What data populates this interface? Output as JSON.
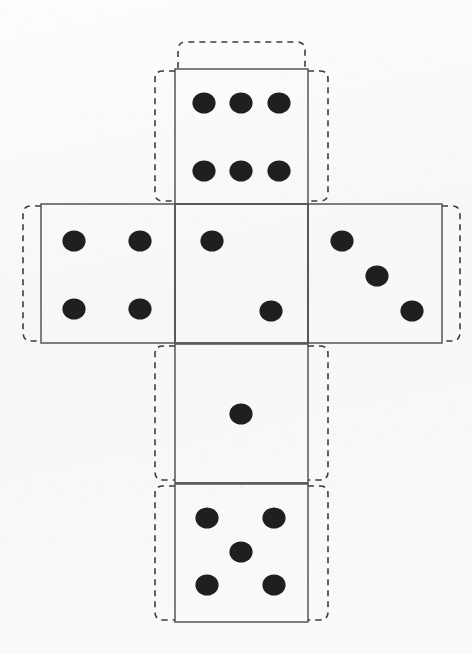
{
  "document": {
    "title": "Dice Net Cut-Out Template",
    "kind": "printable-cube-net",
    "background_color": "#fbfbfb",
    "pip_color": "#1f1f1f",
    "cut_line_color": "#4a4a4a",
    "fold_line_color": "#5a5a5a",
    "tab_line_color": "#3c3c3c",
    "canvas": {
      "width": 472,
      "height": 654
    }
  },
  "net": {
    "face_size": 134,
    "pip_radius": 11,
    "tab_extent": 18,
    "tab_corner_radius": 26,
    "faces": [
      {
        "id": "face-top",
        "name": "top-face",
        "value": 6,
        "value_label": "6",
        "x": 175,
        "y": 69,
        "width": 133,
        "height": 135,
        "pips": [
          {
            "cx": 204,
            "cy": 103
          },
          {
            "cx": 241,
            "cy": 103
          },
          {
            "cx": 279,
            "cy": 103
          },
          {
            "cx": 204,
            "cy": 171
          },
          {
            "cx": 241,
            "cy": 171
          },
          {
            "cx": 279,
            "cy": 171
          }
        ],
        "tabs": [
          "top",
          "left",
          "right"
        ]
      },
      {
        "id": "face-left",
        "name": "left-face",
        "value": 4,
        "value_label": "4",
        "x": 41,
        "y": 204,
        "width": 134,
        "height": 139,
        "pips": [
          {
            "cx": 74,
            "cy": 241
          },
          {
            "cx": 140,
            "cy": 241
          },
          {
            "cx": 74,
            "cy": 309
          },
          {
            "cx": 140,
            "cy": 309
          }
        ],
        "tabs": [
          "left"
        ]
      },
      {
        "id": "face-front",
        "name": "front-face",
        "value": 2,
        "value_label": "2",
        "x": 175,
        "y": 204,
        "width": 133,
        "height": 139,
        "pips": [
          {
            "cx": 212,
            "cy": 241
          },
          {
            "cx": 271,
            "cy": 311
          }
        ],
        "tabs": []
      },
      {
        "id": "face-right",
        "name": "right-face",
        "value": 3,
        "value_label": "3",
        "x": 308,
        "y": 204,
        "width": 134,
        "height": 139,
        "pips": [
          {
            "cx": 342,
            "cy": 241
          },
          {
            "cx": 377,
            "cy": 276
          },
          {
            "cx": 412,
            "cy": 311
          }
        ],
        "tabs": [
          "right"
        ]
      },
      {
        "id": "face-back",
        "name": "back-face",
        "value": 1,
        "value_label": "1",
        "x": 175,
        "y": 344,
        "width": 133,
        "height": 139,
        "pips": [
          {
            "cx": 241,
            "cy": 414
          }
        ],
        "tabs": [
          "left",
          "right"
        ]
      },
      {
        "id": "face-bottom",
        "name": "bottom-face",
        "value": 5,
        "value_label": "5",
        "x": 175,
        "y": 484,
        "width": 133,
        "height": 138,
        "pips": [
          {
            "cx": 207,
            "cy": 518
          },
          {
            "cx": 274,
            "cy": 518
          },
          {
            "cx": 241,
            "cy": 552
          },
          {
            "cx": 207,
            "cy": 585
          },
          {
            "cx": 274,
            "cy": 585
          }
        ],
        "tabs": [
          "left",
          "right",
          "bottom"
        ]
      }
    ],
    "glue_tabs": [
      {
        "id": "tab-top",
        "name": "glue-tab-top",
        "d": "M 178 68 L 178 50 Q 178 42 186 42 L 297 42 Q 305 42 305 50 L 305 68"
      },
      {
        "id": "tab-top-left",
        "name": "glue-tab-top-left",
        "d": "M 175 71 L 163 71 Q 155 71 155 79 L 155 193 Q 155 201 163 201 L 175 201"
      },
      {
        "id": "tab-top-right",
        "name": "glue-tab-top-right",
        "d": "M 308 71 L 320 71 Q 328 71 328 79 L 328 193 Q 328 201 320 201 L 308 201"
      },
      {
        "id": "tab-left",
        "name": "glue-tab-left",
        "d": "M 41 206 L 31 206 Q 23 206 23 214 L 23 332 Q 23 341 31 341 L 41 341"
      },
      {
        "id": "tab-right",
        "name": "glue-tab-right",
        "d": "M 442 206 L 452 206 Q 460 206 460 214 L 460 332 Q 460 341 452 341 L 442 341"
      },
      {
        "id": "tab-back-left",
        "name": "glue-tab-back-left",
        "d": "M 175 346 L 163 346 Q 155 346 155 354 L 155 472 Q 155 480 163 480 L 175 480"
      },
      {
        "id": "tab-back-right",
        "name": "glue-tab-back-right",
        "d": "M 308 346 L 320 346 Q 328 346 328 354 L 328 472 Q 328 480 320 480 L 308 480"
      },
      {
        "id": "tab-bottom-left",
        "name": "glue-tab-bottom-left",
        "d": "M 175 486 L 163 486 Q 155 486 155 494 L 155 612 Q 155 620 163 620 L 175 620"
      },
      {
        "id": "tab-bottom-right",
        "name": "glue-tab-bottom-right",
        "d": "M 308 486 L 320 486 Q 328 486 328 494 L 328 612 Q 328 620 320 620 L 308 620"
      }
    ],
    "fold_lines": [
      {
        "id": "fold-top-front",
        "name": "fold-line-top-front",
        "x1": 175,
        "y1": 204,
        "x2": 308,
        "y2": 204
      },
      {
        "id": "fold-left-front",
        "name": "fold-line-left-front",
        "x1": 175,
        "y1": 204,
        "x2": 175,
        "y2": 343
      },
      {
        "id": "fold-right-front",
        "name": "fold-line-right-front",
        "x1": 308,
        "y1": 204,
        "x2": 308,
        "y2": 343
      },
      {
        "id": "fold-front-back",
        "name": "fold-line-front-back",
        "x1": 175,
        "y1": 343,
        "x2": 308,
        "y2": 343
      },
      {
        "id": "fold-back-bottom",
        "name": "fold-line-back-bottom",
        "x1": 175,
        "y1": 483,
        "x2": 308,
        "y2": 483
      }
    ]
  }
}
